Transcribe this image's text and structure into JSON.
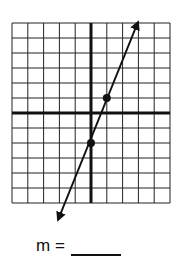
{
  "chart_data": {
    "type": "line",
    "title": "",
    "xlabel": "",
    "ylabel": "",
    "xlim": [
      -5,
      5
    ],
    "ylim": [
      -6,
      6
    ],
    "grid": true,
    "grid_step": 1,
    "series": [
      {
        "name": "line",
        "marked_points": [
          [
            1,
            1
          ],
          [
            0,
            -2
          ]
        ],
        "equation_slope": 3,
        "endpoints_with_arrows": [
          [
            -2.0,
            -8.0
          ],
          [
            3.0,
            7.0
          ]
        ]
      }
    ]
  },
  "answer": {
    "label": "m =",
    "blank": ""
  },
  "colors": {
    "grid": "#222222",
    "axis": "#111111",
    "line": "#111111"
  }
}
